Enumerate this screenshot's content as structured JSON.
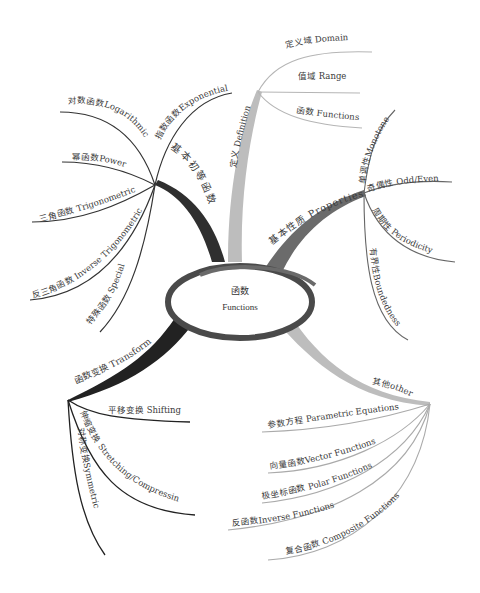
{
  "center": {
    "label_cn": "函数",
    "label_en": "Functions"
  },
  "colors": {
    "dark_branch": "#2f2f2f",
    "mid_branch": "#6b6b6b",
    "light_branch": "#b8b8b8",
    "leaf_dark": "#333333",
    "leaf_light": "#9a9a9a",
    "text": "#3a3a3a"
  },
  "branches": {
    "elementary": {
      "label": "基本初等函数",
      "children": [
        "指数函数Exponential",
        "对数函数Logarithmic",
        "幂函数Power",
        "三角函数 Trigonometric",
        "反三角函数  Inverse Trigonometric",
        "特殊函数  Special"
      ]
    },
    "definition": {
      "label": "定义 Definition",
      "children": [
        "定义域 Domain",
        "值域 Range",
        "函数 Functions"
      ]
    },
    "properties": {
      "label": "基本性质 Properties",
      "children": [
        "单调性Monotone",
        "奇偶性 Odd/Even",
        "周期性 Periodicity",
        "有界性Boundedness"
      ]
    },
    "transform": {
      "label": "函数变换 Transform",
      "children": [
        "平移变换 Shifting",
        "伸缩变换 Stretching/Compressing",
        "对称变换Symmetric"
      ]
    },
    "other": {
      "label": "其他other",
      "children": [
        "参数方程 Parametric  Equations",
        "向量函数Vector  Functions",
        "极坐标函数 Polar  Functions",
        "反函数Inverse  Functions",
        "复合函数 Composite  Functions"
      ]
    }
  }
}
